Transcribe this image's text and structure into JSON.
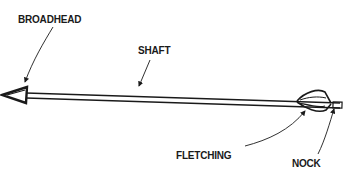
{
  "diagram": {
    "labels": [
      {
        "id": "broadhead",
        "text": "BROADHEAD"
      },
      {
        "id": "shaft",
        "text": "SHAFT"
      },
      {
        "id": "fletching",
        "text": "FLETCHING"
      },
      {
        "id": "nock",
        "text": "NOCK"
      }
    ],
    "colors": {
      "ink": "#1a1a1a",
      "background": "#ffffff"
    }
  }
}
